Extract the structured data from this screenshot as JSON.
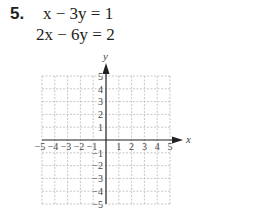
{
  "problem": {
    "number": "5.",
    "equations": [
      "x − 3y = 1",
      "2x − 6y = 2"
    ]
  },
  "graph": {
    "x_label": "x",
    "y_label": "y",
    "x_range": [
      -5,
      5
    ],
    "y_range": [
      -5,
      5
    ],
    "x_ticks": [
      "−5",
      "−4",
      "−3",
      "−2",
      "−1",
      "1",
      "2",
      "3",
      "4",
      "5"
    ],
    "y_ticks": [
      "5",
      "4",
      "3",
      "2",
      "1",
      "−1",
      "−2",
      "−3",
      "−4",
      "−5"
    ],
    "grid_color": "#b0b0b0",
    "axis_color": "#231f20"
  }
}
